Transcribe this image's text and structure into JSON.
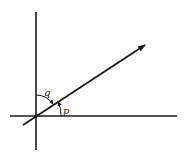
{
  "diagram": {
    "type": "vector-angle-diagram",
    "colors": {
      "stroke": "#1a1a1a",
      "background": "#ffffff"
    },
    "axes": {
      "origin": [
        36,
        116
      ],
      "vertical": {
        "x": 36,
        "y1": 12,
        "y2": 150
      },
      "horizontal": {
        "y": 116,
        "x1": 10,
        "x2": 177
      }
    },
    "vector": {
      "start": [
        23,
        125
      ],
      "end": [
        145,
        45
      ],
      "arrowhead": true
    },
    "angles": [
      {
        "label": "q",
        "between": "vertical-axis and vector"
      },
      {
        "label": "p",
        "between": "horizontal-axis and vector"
      }
    ]
  }
}
